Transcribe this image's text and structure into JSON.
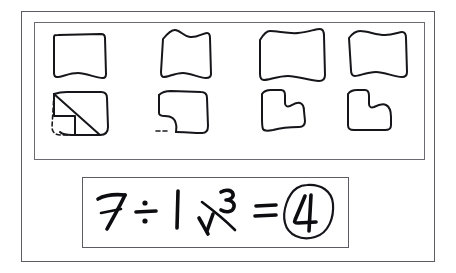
{
  "document": {
    "title": "Paper folding and division worksheet",
    "ink_color": "#15151a",
    "border_color": "#5b5b63",
    "background_color": "#ffffff"
  },
  "shapes_panel": {
    "label": "Folded paper shape sequence",
    "columns": [
      {
        "index": 1,
        "top": {
          "label": "Square sheet",
          "type": "square"
        },
        "bottom": {
          "label": "Square with bottom-left corner folded diagonally",
          "type": "folded-corner",
          "has_dashed_outline": true
        }
      },
      {
        "index": 2,
        "top": {
          "label": "Wavy square sheet",
          "type": "square"
        },
        "bottom": {
          "label": "Sheet with curved notch cut at bottom-left",
          "type": "notched-curve",
          "has_dashed_outline": true
        }
      },
      {
        "index": 3,
        "top": {
          "label": "Wavy square sheet",
          "type": "square"
        },
        "bottom": {
          "label": "L-shaped sheet with notch cut at top-right",
          "type": "notched-L",
          "has_dashed_outline": false
        }
      },
      {
        "index": 4,
        "top": {
          "label": "Wavy square sheet",
          "type": "square"
        },
        "bottom": {
          "label": "Sheet with rounded notch cut at upper-right",
          "type": "notched-round",
          "has_dashed_outline": false
        }
      }
    ]
  },
  "equation": {
    "label": "Handwritten division equation",
    "text": "7 ÷ 1 3/4 = 4",
    "dividend": "7",
    "operator": "÷",
    "divisor_whole": "1",
    "divisor_numerator": "3",
    "divisor_denominator": "4",
    "equals": "=",
    "result": "4",
    "result_circled": true
  }
}
